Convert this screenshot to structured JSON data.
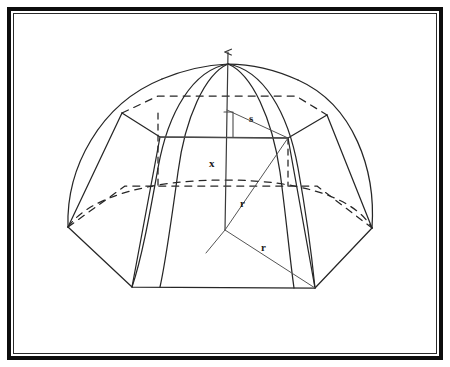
{
  "figure": {
    "type": "geometry-diagram",
    "background_color": "#ffffff",
    "line_color": "#262626",
    "frame": {
      "outer_border_color": "#0d0d0d",
      "inner_border_color": "#2a2a2a",
      "outer_border_width": 4,
      "inner_border_width": 1.2
    }
  },
  "labels": [
    {
      "id": "s",
      "text": "s",
      "x": 249,
      "y": 113,
      "meaning": "slant-segment-from-axis-to-upper-vertex"
    },
    {
      "id": "x",
      "text": "x",
      "x": 209,
      "y": 158,
      "meaning": "vertical-height-along-axis"
    },
    {
      "id": "r-upper",
      "text": "r",
      "x": 240,
      "y": 198,
      "meaning": "radius-from-center-to-upper-vertex"
    },
    {
      "id": "r-lower",
      "text": "r",
      "x": 261,
      "y": 242,
      "meaning": "radius-from-center-to-base-vertex"
    }
  ],
  "geometry": {
    "apex": {
      "x": 228,
      "y": 64
    },
    "center": {
      "x": 225,
      "y": 230
    },
    "key_vertex": {
      "x": 288,
      "y": 138
    },
    "axis_arrow_tip": {
      "x": 228,
      "y": 48
    },
    "base_vertices": [
      {
        "name": "base-left",
        "x": 68,
        "y": 227
      },
      {
        "name": "base-front-left",
        "x": 132,
        "y": 287
      },
      {
        "name": "base-front-right",
        "x": 315,
        "y": 288
      },
      {
        "name": "base-right",
        "x": 372,
        "y": 228
      },
      {
        "name": "base-back-right",
        "x": 317,
        "y": 186
      },
      {
        "name": "base-back-left",
        "x": 125,
        "y": 186
      }
    ],
    "upper_vertices": [
      {
        "name": "upper-left",
        "x": 122,
        "y": 113
      },
      {
        "name": "upper-front-left",
        "x": 160,
        "y": 137
      },
      {
        "name": "upper-front-right",
        "x": 288,
        "y": 138
      },
      {
        "name": "upper-right",
        "x": 327,
        "y": 115
      },
      {
        "name": "upper-back-right",
        "x": 296,
        "y": 96
      },
      {
        "name": "upper-back-left",
        "x": 158,
        "y": 96
      }
    ],
    "dome_radius_x": 160,
    "dome_radius_y": 164
  }
}
